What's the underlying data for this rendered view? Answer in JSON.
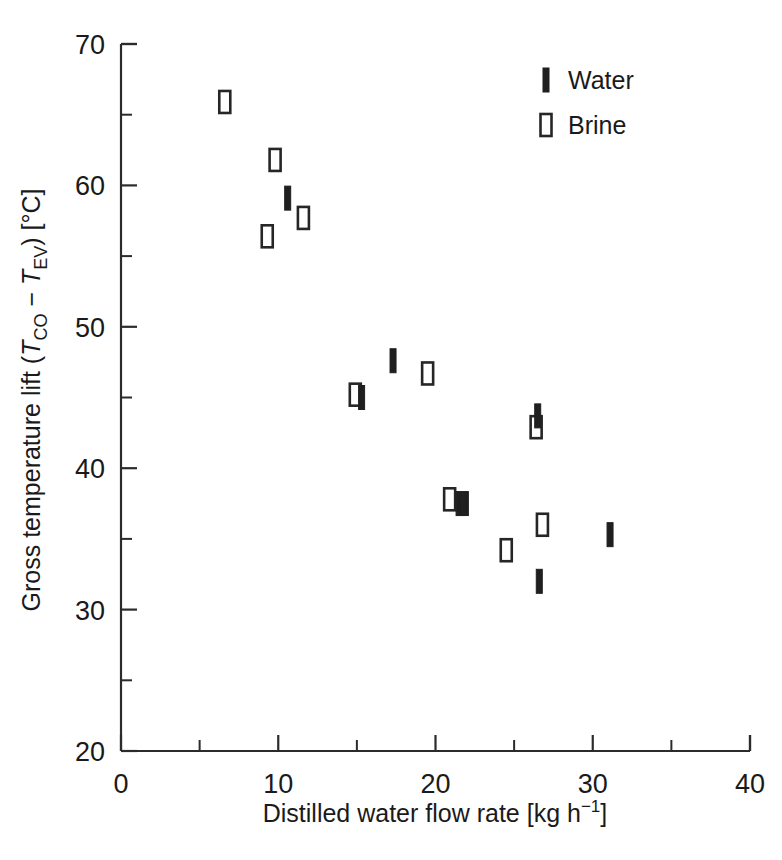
{
  "chart_data": {
    "type": "scatter",
    "title": "",
    "xlabel": "Distilled water flow rate [kg h−1]",
    "xlabel_parts": {
      "main": "Distilled water flow rate [kg h",
      "sup": "−1",
      "tail": "]"
    },
    "ylabel": "Gross temperature lift (TCO − TEV) [°C]",
    "ylabel_parts": {
      "p1": "Gross temperature lift (",
      "i1": "T",
      "s1": "CO",
      "op": " − ",
      "i2": "T",
      "s2": "EV",
      "p2": ") [°C]"
    },
    "xlim": [
      0,
      40
    ],
    "ylim": [
      20,
      70
    ],
    "x_ticks": [
      0,
      10,
      20,
      30,
      40
    ],
    "x_ticks_minor": [
      5,
      15,
      25,
      35
    ],
    "y_ticks": [
      20,
      30,
      40,
      50,
      60,
      70
    ],
    "y_ticks_minor": [
      25,
      35,
      45,
      55,
      65
    ],
    "grid": false,
    "legend_position": "top-right",
    "legend": [
      {
        "name": "Water",
        "marker": "filled-vertical-bar",
        "color": "#1f1f1f"
      },
      {
        "name": "Brine",
        "marker": "open-rectangle",
        "color": "#262626"
      }
    ],
    "series": [
      {
        "name": "Water",
        "marker": "filled-vertical-bar",
        "color": "#1f1f1f",
        "points": [
          {
            "x": 10.6,
            "y": 59.1
          },
          {
            "x": 17.3,
            "y": 47.6
          },
          {
            "x": 15.3,
            "y": 45.0
          },
          {
            "x": 21.9,
            "y": 37.5
          },
          {
            "x": 26.5,
            "y": 43.7
          },
          {
            "x": 21.5,
            "y": 37.5
          },
          {
            "x": 26.6,
            "y": 32.0
          },
          {
            "x": 31.1,
            "y": 35.3
          }
        ]
      },
      {
        "name": "Brine",
        "marker": "open-rectangle",
        "color": "#262626",
        "points": [
          {
            "x": 6.6,
            "y": 65.9
          },
          {
            "x": 9.8,
            "y": 61.8
          },
          {
            "x": 9.3,
            "y": 56.4
          },
          {
            "x": 11.6,
            "y": 57.7
          },
          {
            "x": 14.9,
            "y": 45.2
          },
          {
            "x": 19.5,
            "y": 46.7
          },
          {
            "x": 20.9,
            "y": 37.8
          },
          {
            "x": 26.4,
            "y": 42.9
          },
          {
            "x": 26.8,
            "y": 36.0
          },
          {
            "x": 24.5,
            "y": 34.2
          }
        ]
      }
    ]
  },
  "axes": {
    "x_tick_labels": [
      "0",
      "10",
      "20",
      "30",
      "40"
    ],
    "y_tick_labels": [
      "20",
      "30",
      "40",
      "50",
      "60",
      "70"
    ]
  }
}
